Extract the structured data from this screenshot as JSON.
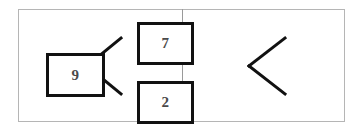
{
  "figure": {
    "background_color": "#ffffff",
    "frame_color": "#b5b5b5",
    "divider_color": "#9a9a9a",
    "box_border_color": "#111111",
    "box_fill_color": "#ffffff",
    "connector_color": "#111111",
    "label_color": "#4a4a4a"
  },
  "panels": [
    {
      "id": "left",
      "parent": {
        "value": "9"
      },
      "children": [
        {
          "value": "7",
          "position": "top"
        },
        {
          "value": "2",
          "position": "bottom"
        }
      ],
      "connectors": [
        {
          "from": "parent",
          "to": "child-top"
        },
        {
          "from": "parent",
          "to": "child-bottom"
        }
      ]
    },
    {
      "id": "right",
      "parent": {
        "value": "10"
      },
      "children": [
        {
          "value": "7",
          "position": "top"
        },
        {
          "value": "3",
          "position": "bottom"
        }
      ],
      "connectors": [
        {
          "from": "parent",
          "to": "child-top"
        },
        {
          "from": "parent",
          "to": "child-bottom"
        }
      ]
    }
  ]
}
